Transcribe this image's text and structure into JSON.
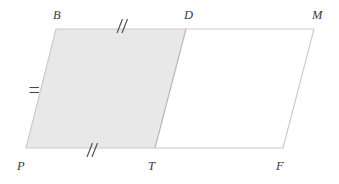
{
  "figure": {
    "canvas": {
      "width": 339,
      "height": 184,
      "background": "#ffffff"
    },
    "colors": {
      "shade_fill": "#e8e8e8",
      "outline": "#c9c9c9",
      "divider": "#b9b9b9",
      "tick": "#4a4a4a",
      "label_text": "#3a3a3a"
    },
    "vertices": [
      {
        "name": "B",
        "label": "B",
        "x": 56,
        "y": 29,
        "label_x": 53,
        "label_y": 9
      },
      {
        "name": "D",
        "label": "D",
        "x": 186,
        "y": 29,
        "label_x": 184,
        "label_y": 9
      },
      {
        "name": "M",
        "label": "M",
        "x": 314,
        "y": 29,
        "label_x": 312,
        "label_y": 9
      },
      {
        "name": "P",
        "label": "P",
        "x": 26,
        "y": 148,
        "label_x": 17,
        "label_y": 160
      },
      {
        "name": "T",
        "label": "T",
        "x": 155,
        "y": 148,
        "label_x": 148,
        "label_y": 160
      },
      {
        "name": "F",
        "label": "F",
        "x": 283,
        "y": 148,
        "label_x": 276,
        "label_y": 160
      }
    ],
    "shaded_region": {
      "name": "parallelogram-PBDT",
      "vertices": [
        "P",
        "B",
        "D",
        "T"
      ],
      "filled": true
    },
    "unshaded_region": {
      "name": "parallelogram-TDMF",
      "vertices": [
        "T",
        "D",
        "M",
        "F"
      ],
      "filled": false
    },
    "tick_marks": [
      {
        "name": "tick-bd",
        "segment": "BD",
        "style": "double-slash",
        "count": 2,
        "x": 120,
        "y": 25
      },
      {
        "name": "tick-pt",
        "segment": "PT",
        "style": "double-slash",
        "count": 2,
        "x": 90,
        "y": 149
      },
      {
        "name": "tick-pb",
        "segment": "PB",
        "style": "double-dash",
        "count": 2,
        "x": 34,
        "y": 90
      }
    ]
  }
}
